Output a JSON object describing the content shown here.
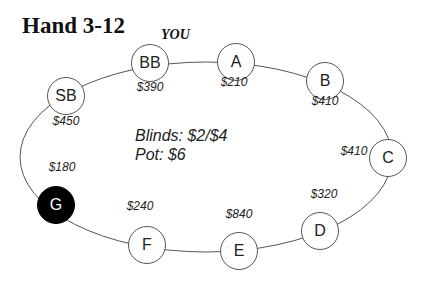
{
  "title": "Hand 3-12",
  "you_label": "YOU",
  "table": {
    "blinds": "Blinds: $2/$4",
    "pot": "Pot: $6"
  },
  "seats": [
    {
      "name": "SB",
      "stack": "$450",
      "x": 66,
      "y": 96,
      "sx": 66,
      "sy": 121,
      "highlighted": false
    },
    {
      "name": "BB",
      "stack": "$390",
      "x": 150,
      "y": 63,
      "sx": 150,
      "sy": 87,
      "highlighted": false
    },
    {
      "name": "A",
      "stack": "$210",
      "x": 236,
      "y": 62,
      "sx": 234,
      "sy": 82,
      "highlighted": false
    },
    {
      "name": "B",
      "stack": "$410",
      "x": 325,
      "y": 81,
      "sx": 325,
      "sy": 101,
      "highlighted": false
    },
    {
      "name": "C",
      "stack": "$410",
      "x": 388,
      "y": 158,
      "sx": 354,
      "sy": 151,
      "highlighted": false
    },
    {
      "name": "D",
      "stack": "$320",
      "x": 320,
      "y": 231,
      "sx": 324,
      "sy": 194,
      "highlighted": false
    },
    {
      "name": "E",
      "stack": "$840",
      "x": 239,
      "y": 251,
      "sx": 239,
      "sy": 214,
      "highlighted": false
    },
    {
      "name": "F",
      "stack": "$240",
      "x": 147,
      "y": 245,
      "sx": 140,
      "sy": 206,
      "highlighted": false
    },
    {
      "name": "G",
      "stack": "$180",
      "x": 56,
      "y": 205,
      "sx": 62,
      "sy": 167,
      "highlighted": true
    }
  ]
}
